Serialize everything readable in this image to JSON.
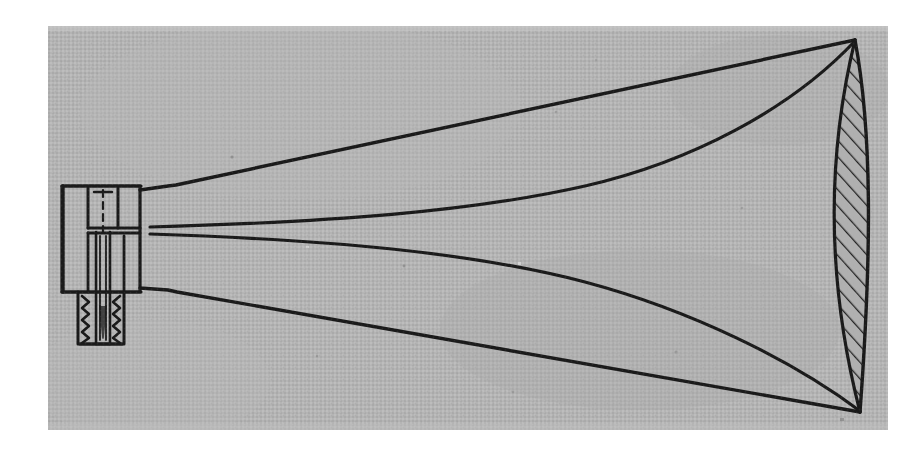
{
  "figure": {
    "domain": "Natural-Image",
    "kind": "scanned-halftone-photograph",
    "caption": "",
    "labels": [],
    "annotations": [],
    "visible_text": [],
    "colors": {
      "page_background": "#ffffff",
      "photo_background": "#b2b2b2",
      "photo_background_light": "#bcbcbc",
      "photo_background_dark": "#a6a6a6",
      "ink": "#1a1a1a",
      "ink_soft": "#2b2b2b",
      "hatch": "#232323"
    },
    "photo_frame": {
      "x": 48,
      "y": 26,
      "width": 840,
      "height": 404
    },
    "parts": [
      {
        "name": "driver-connector-flange",
        "description": "Rectangular mounting flange body at throat end"
      },
      {
        "name": "threaded-stud",
        "description": "Externally threaded screw boss below the flange"
      },
      {
        "name": "centerline",
        "description": "Dashed vertical axis line through flange"
      },
      {
        "name": "throat-bore",
        "description": "Narrow parallel-walled throat channel"
      },
      {
        "name": "horn-outer-upper",
        "description": "Straight upper outer profile from flange to mouth apex"
      },
      {
        "name": "horn-outer-lower",
        "description": "Straight lower outer profile from flange to mouth apex"
      },
      {
        "name": "horn-inner-upper",
        "description": "Exponentially flaring upper inner wall"
      },
      {
        "name": "horn-inner-lower",
        "description": "Exponentially flaring lower inner wall"
      },
      {
        "name": "mouth-section",
        "description": "Hatched lens-shaped mouth rim cross-section"
      }
    ],
    "geometry": {
      "mouth_apex_top": [
        855,
        40
      ],
      "mouth_apex_bottom": [
        860,
        412
      ],
      "throat_top_y": 227,
      "throat_bottom_y": 234,
      "flange_left_x": 62,
      "flange_top_y": 185
    }
  }
}
